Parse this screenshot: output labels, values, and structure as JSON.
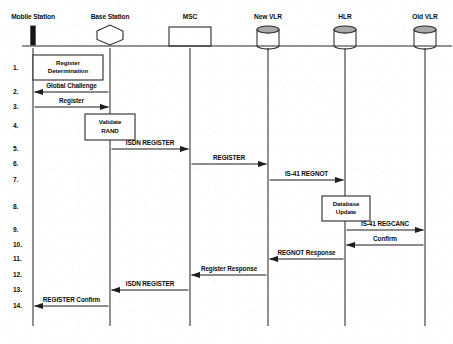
{
  "diagram": {
    "type": "sequence-diagram",
    "actors": [
      {
        "id": "mobile-station",
        "label": "Mobile Station",
        "icon": "mobile-handset-icon",
        "x": 33
      },
      {
        "id": "base-station",
        "label": "Base Station",
        "icon": "hexagon-icon",
        "x": 110
      },
      {
        "id": "msc",
        "label": "MSC",
        "icon": "rectangle-icon",
        "x": 190
      },
      {
        "id": "new-vlr",
        "label": "New VLR",
        "icon": "database-cylinder-icon",
        "x": 268
      },
      {
        "id": "hlr",
        "label": "HLR",
        "icon": "database-cylinder-icon",
        "x": 345
      },
      {
        "id": "old-vlr",
        "label": "Old VLR",
        "icon": "database-cylinder-icon",
        "x": 425
      }
    ],
    "lifeline": {
      "top": 48,
      "bottom": 326
    },
    "baseline_y": 46,
    "steps": [
      {
        "number": "1.",
        "y": 68,
        "kind": "process",
        "label": "Register Determination",
        "label_lines": [
          "Register",
          "Determination"
        ],
        "from": "mobile-station",
        "to": "base-station",
        "box": {
          "x": 33,
          "y": 55,
          "w": 70,
          "h": 25
        }
      },
      {
        "number": "2.",
        "y": 92,
        "kind": "message",
        "label": "Global Challenge",
        "from": "base-station",
        "to": "mobile-station",
        "direction": "left"
      },
      {
        "number": "3.",
        "y": 107,
        "kind": "message",
        "label": "Register",
        "from": "mobile-station",
        "to": "base-station",
        "direction": "right"
      },
      {
        "number": "4.",
        "y": 126,
        "kind": "process",
        "label": "Validate RAND",
        "label_lines": [
          "Validate",
          "RAND"
        ],
        "on": "base-station",
        "box": {
          "x": 85,
          "y": 114,
          "w": 50,
          "h": 26
        }
      },
      {
        "number": "5.",
        "y": 149,
        "kind": "message",
        "label": "ISDN REGISTER",
        "from": "base-station",
        "to": "msc",
        "direction": "right"
      },
      {
        "number": "6.",
        "y": 164,
        "kind": "message",
        "label": "REGISTER",
        "from": "msc",
        "to": "new-vlr",
        "direction": "right"
      },
      {
        "number": "7.",
        "y": 180,
        "kind": "message",
        "label": "IS-41 REGNOT",
        "from": "new-vlr",
        "to": "hlr",
        "direction": "right"
      },
      {
        "number": "8.",
        "y": 207,
        "kind": "process",
        "label": "Database Update",
        "label_lines": [
          "Database",
          "Update"
        ],
        "on": "hlr",
        "box": {
          "x": 322,
          "y": 196,
          "w": 48,
          "h": 25
        }
      },
      {
        "number": "9.",
        "y": 230,
        "kind": "message",
        "label": "IS-41 REGCANC",
        "from": "hlr",
        "to": "old-vlr",
        "direction": "right"
      },
      {
        "number": "10.",
        "y": 245,
        "kind": "message",
        "label": "Confirm",
        "from": "old-vlr",
        "to": "hlr",
        "direction": "left"
      },
      {
        "number": "11.",
        "y": 259,
        "kind": "message",
        "label": "REGNOT Response",
        "from": "hlr",
        "to": "new-vlr",
        "direction": "left"
      },
      {
        "number": "12.",
        "y": 275,
        "kind": "message",
        "label": "Register Response",
        "from": "new-vlr",
        "to": "msc",
        "direction": "left"
      },
      {
        "number": "13.",
        "y": 290,
        "kind": "message",
        "label": "ISDN REGISTER",
        "from": "msc",
        "to": "base-station",
        "direction": "left"
      },
      {
        "number": "14.",
        "y": 306,
        "kind": "message",
        "label": "REGISTER Confirm",
        "from": "base-station",
        "to": "mobile-station",
        "direction": "left"
      }
    ],
    "colors": {
      "line": "#2b2b2b",
      "text": "#0d0d0d",
      "cylinder_top": "#a8a8a8",
      "background": "#ffffff"
    }
  }
}
